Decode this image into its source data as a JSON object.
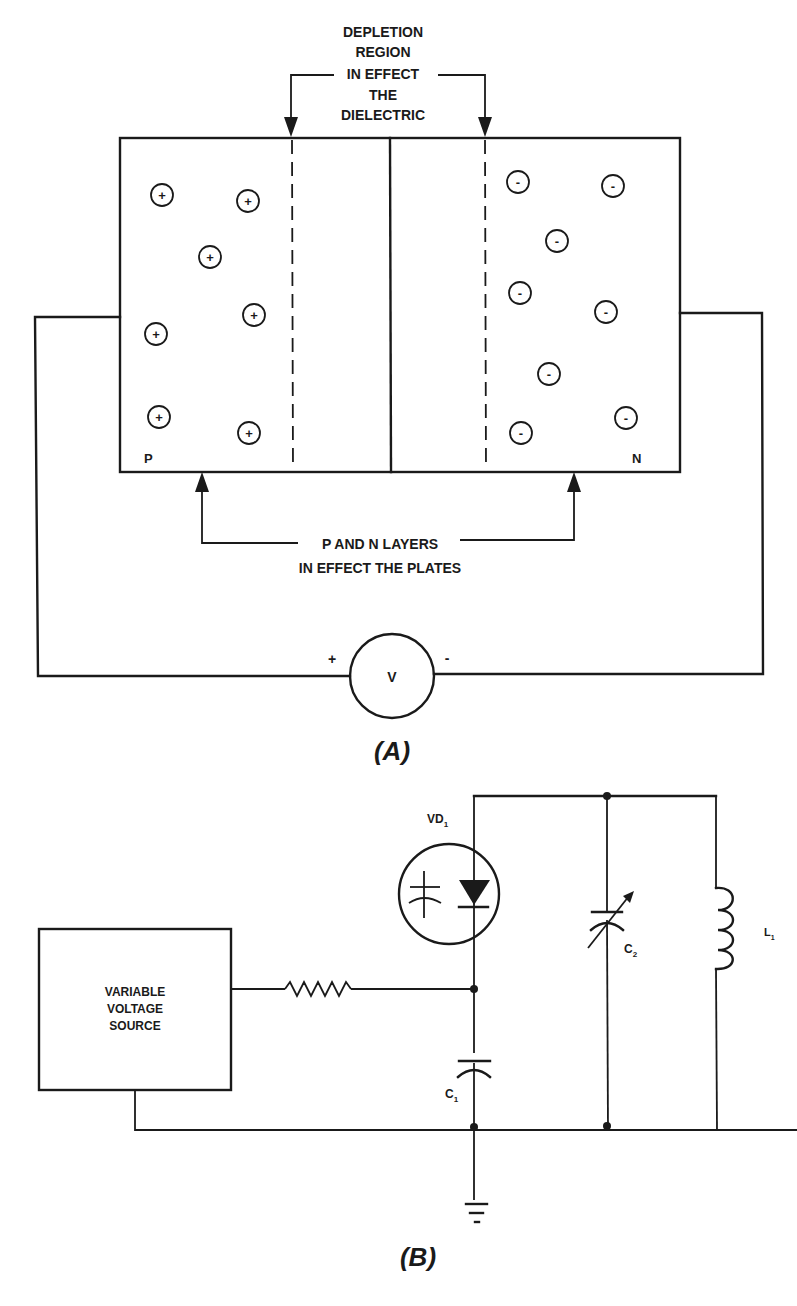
{
  "figure_a": {
    "caption": "(A)",
    "depletion_label": [
      "DEPLETION",
      "REGION",
      "IN EFFECT",
      "THE",
      "DIELECTRIC"
    ],
    "plates_label": [
      "P AND N LAYERS",
      "IN EFFECT THE PLATES"
    ],
    "p_region_label": "P",
    "n_region_label": "N",
    "p_charge_symbol": "+",
    "n_charge_symbol": "-",
    "p_charge_count": 7,
    "n_charge_count": 8,
    "voltmeter_label": "V",
    "positive_terminal": "+",
    "negative_terminal": "-"
  },
  "figure_b": {
    "caption": "(B)",
    "source_label": [
      "VARIABLE",
      "VOLTAGE",
      "SOURCE"
    ],
    "varactor_label": "VD",
    "varactor_subscript": "1",
    "capacitor1_label": "C",
    "capacitor1_subscript": "1",
    "capacitor2_label": "C",
    "capacitor2_subscript": "2",
    "inductor_label": "L",
    "inductor_subscript": "1"
  },
  "colors": {
    "ink": "#1a1a1a",
    "paper": "#ffffff"
  }
}
